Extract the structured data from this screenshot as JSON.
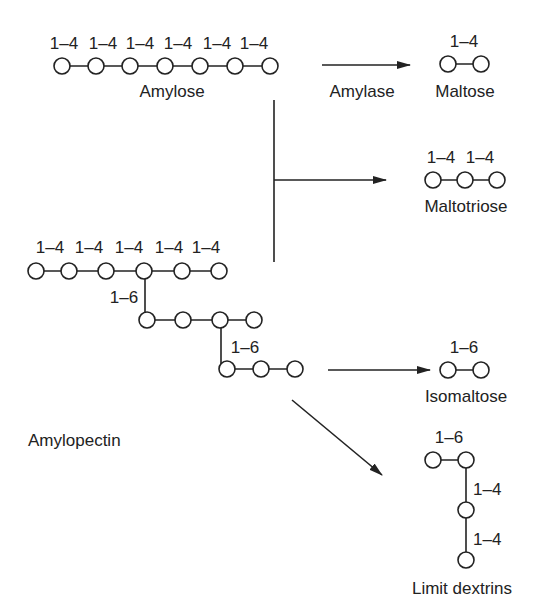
{
  "diagram": {
    "colors": {
      "ink": "#222222",
      "background": "#ffffff"
    },
    "amylose": {
      "name": "Amylose",
      "residues": 7,
      "bond_labels": [
        "1–4",
        "1–4",
        "1–4",
        "1–4",
        "1–4",
        "1–4"
      ]
    },
    "enzyme": {
      "label": "Amylase"
    },
    "amylopectin": {
      "name": "Amylopectin",
      "main_chain_bond_labels": [
        "1–4",
        "1–4",
        "1–4",
        "1–4",
        "1–4"
      ],
      "branch1_label": "1–6",
      "branch2_label": "1–6"
    },
    "products": {
      "maltose": {
        "name": "Maltose",
        "bond_labels": [
          "1–4"
        ]
      },
      "maltotriose": {
        "name": "Maltotriose",
        "bond_labels": [
          "1–4",
          "1–4"
        ]
      },
      "isomaltose": {
        "name": "Isomaltose",
        "bond_labels": [
          "1–6"
        ]
      },
      "limit_dextrins": {
        "name": "Limit dextrins",
        "bond_labels": [
          "1–6",
          "1–4",
          "1–4"
        ]
      }
    }
  }
}
